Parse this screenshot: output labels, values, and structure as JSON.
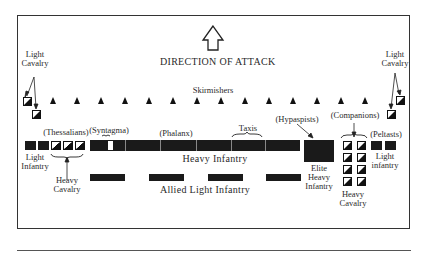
{
  "title": "DIRECTION OF ATTACK",
  "skirmishers": {
    "label": "Skirmishers",
    "count": 14
  },
  "left_wing": {
    "light_cavalry_label": "Light Cavalry",
    "light_infantry_label": "Light Infantry",
    "thessalians_label": "(Thessalians)",
    "heavy_cavalry_label": "Heavy Cavalry"
  },
  "center": {
    "syntagma_label": "(Syntagma)",
    "phalanx_label": "(Phalanx)",
    "taxis_label": "Taxis",
    "heavy_infantry_label": "Heavy Infantry",
    "allied_label": "Allied Light Infantry"
  },
  "right_wing": {
    "hypaspists_label": "(Hypaspists)",
    "elite_label": "Elite Heavy Infantry",
    "companions_label": "(Companions)",
    "heavy_cavalry_label": "Heavy Cavalry",
    "peltasts_label": "(Peltasts)",
    "light_infantry_label": "Light infantry",
    "light_cavalry_label": "Light Cavalry"
  },
  "colors": {
    "unit": "#1a1a1a",
    "background": "#ffffff",
    "frame": "#333333"
  }
}
